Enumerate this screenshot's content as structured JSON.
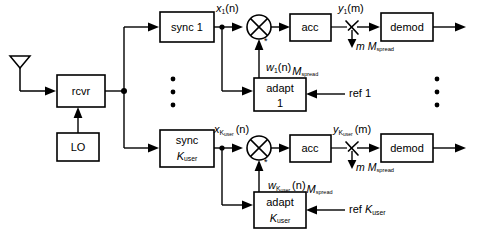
{
  "figure": {
    "type": "block-diagram",
    "domain": "communications-receiver"
  },
  "blocks": {
    "antenna": {
      "name": "antenna",
      "label": ""
    },
    "rcvr": {
      "label": "rcvr"
    },
    "lo": {
      "label": "LO"
    },
    "sync_1": {
      "label_line1": "sync 1",
      "label_line2": ""
    },
    "sync_k": {
      "label_line1": "sync",
      "label_line2_main": "K",
      "label_line2_sub": "user"
    },
    "acc_1": {
      "label": "acc"
    },
    "acc_k": {
      "label": "acc"
    },
    "demod_1": {
      "label": "demod"
    },
    "demod_k": {
      "label": "demod"
    },
    "adapt_1": {
      "label_line1": "adapt",
      "label_line2": "1"
    },
    "adapt_k": {
      "label_line1": "adapt",
      "label_line2_main": "K",
      "label_line2_sub": "user"
    }
  },
  "signals": {
    "x_1": {
      "var": "x",
      "sub": "1",
      "arg": "(n)"
    },
    "x_k": {
      "var": "x",
      "sub": "K",
      "sub2": "user",
      "arg": "(n)"
    },
    "w_1": {
      "var": "w",
      "sub": "1",
      "arg": "(n)",
      "restrict_var": "M",
      "restrict_sub": "spread"
    },
    "w_k": {
      "var": "w",
      "sub": "K",
      "sub2": "user",
      "arg": "(n)",
      "restrict_var": "M",
      "restrict_sub": "spread"
    },
    "y_1": {
      "var": "y",
      "sub": "1",
      "arg": "(m)"
    },
    "y_k": {
      "var": "y",
      "sub": "K",
      "sub2": "user",
      "arg": "(m)"
    },
    "sample_1": {
      "var": "m",
      "mvar": "M",
      "msub": "spread"
    },
    "sample_k": {
      "var": "m",
      "mvar": "M",
      "msub": "spread"
    },
    "conj_mark_1": "*",
    "conj_mark_k": "*"
  },
  "references": {
    "ref_1": {
      "text": "ref 1"
    },
    "ref_k": {
      "text_prefix": "ref ",
      "var": "K",
      "sub": "user"
    }
  },
  "ellipsis": {
    "left_column": "⋮",
    "right_column": "⋮"
  },
  "colors": {
    "stroke": "#000000",
    "background": "#ffffff",
    "fill": "#ffffff"
  }
}
